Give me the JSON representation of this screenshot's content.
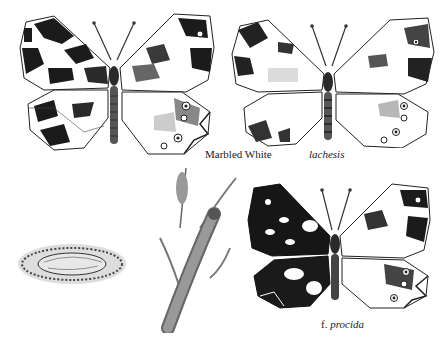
{
  "plate": {
    "background": "#ffffff",
    "ink": "#1a1a1a",
    "figures": [
      {
        "id": "marbled-white",
        "kind": "butterfly",
        "label": "Marbled White",
        "label_style": "roman",
        "pattern": "light"
      },
      {
        "id": "lachesis",
        "kind": "butterfly",
        "label": "lachesis",
        "label_style": "italic",
        "pattern": "pale"
      },
      {
        "id": "pupa",
        "kind": "pupa",
        "label": ""
      },
      {
        "id": "larva",
        "kind": "caterpillar-on-grass",
        "label": ""
      },
      {
        "id": "procida",
        "kind": "butterfly",
        "label": "f. procida",
        "label_prefix": "f.",
        "label_name": "procida",
        "label_style": "italic",
        "pattern": "dark"
      }
    ]
  },
  "labels": {
    "marbled_white": "Marbled White",
    "lachesis": "lachesis",
    "procida_prefix": "f.",
    "procida_name": "procida"
  }
}
